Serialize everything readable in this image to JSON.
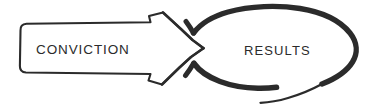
{
  "diagram": {
    "type": "hand-drawn-flow-diagram",
    "background_color": "#ffffff",
    "ink_color": "#2b2b2b",
    "arrow": {
      "label": "CONVICTION",
      "shape": "block-arrow",
      "direction": "right",
      "stroke_style": "thin-hand-drawn-outline",
      "fill": "#ffffff"
    },
    "loop": {
      "label": "RESULTS",
      "shape": "oval-spiral-loop",
      "stroke_style": "thick-hand-drawn",
      "fill": "none"
    },
    "relationship": "CONVICTION leads to RESULTS"
  }
}
